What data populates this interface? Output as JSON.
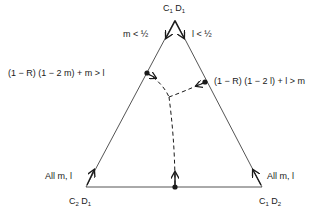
{
  "vertices": {
    "top": {
      "c": "C",
      "c_sub": "1",
      "d": "D",
      "d_sub": "1"
    },
    "bottom_left": {
      "c": "C",
      "c_sub": "2",
      "d": "D",
      "d_sub": "1"
    },
    "bottom_right": {
      "c": "C",
      "c_sub": "1",
      "d": "D",
      "d_sub": "2"
    }
  },
  "labels": {
    "top_left_condition": "m < ½",
    "top_right_condition": "l < ½",
    "left_edge_condition": "(1 − R) (1 − 2 m) + m > l",
    "right_edge_condition": "(1 − R) (1 − 2 l) + l > m",
    "bottom_left_condition": "All m, l",
    "bottom_right_condition": "All m, l"
  },
  "colors": {
    "line": "#555555",
    "ink": "#1a1a1a",
    "background": "#ffffff"
  }
}
